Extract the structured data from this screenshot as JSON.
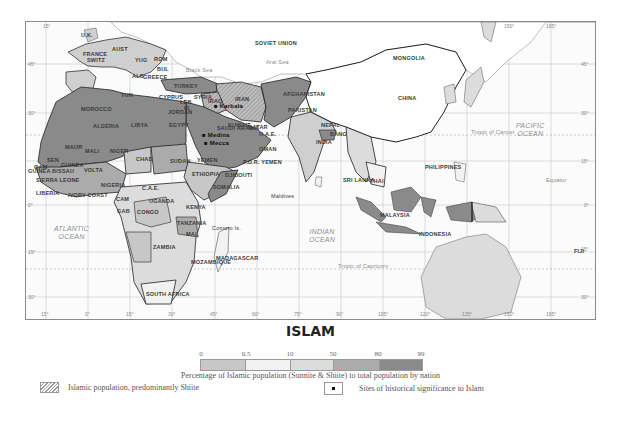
{
  "map": {
    "title": "ISLAM",
    "type": "choropleth",
    "countries": [
      {
        "name": "SOVIET UNION",
        "x": 229,
        "y": 19
      },
      {
        "name": "MONGOLIA",
        "x": 367,
        "y": 34
      },
      {
        "name": "CHINA",
        "x": 372,
        "y": 74
      },
      {
        "name": "U.K.",
        "x": 55,
        "y": 11
      },
      {
        "name": "FRANCE",
        "x": 57,
        "y": 30
      },
      {
        "name": "SWITZ",
        "x": 61,
        "y": 36
      },
      {
        "name": "AUST",
        "x": 86,
        "y": 25
      },
      {
        "name": "YUG",
        "x": 109,
        "y": 36
      },
      {
        "name": "ROM",
        "x": 128,
        "y": 35
      },
      {
        "name": "BUL",
        "x": 131,
        "y": 45
      },
      {
        "name": "ALB",
        "x": 106,
        "y": 52
      },
      {
        "name": "GREECE",
        "x": 117,
        "y": 53
      },
      {
        "name": "TURKEY",
        "x": 148,
        "y": 62
      },
      {
        "name": "CYPRUS",
        "x": 133,
        "y": 73
      },
      {
        "name": "SYRIA",
        "x": 168,
        "y": 73
      },
      {
        "name": "LEB",
        "x": 154,
        "y": 78
      },
      {
        "name": "IS",
        "x": 158,
        "y": 84
      },
      {
        "name": "IRAQ",
        "x": 182,
        "y": 77
      },
      {
        "name": "IRAN",
        "x": 209,
        "y": 75
      },
      {
        "name": "AFGHANISTAN",
        "x": 257,
        "y": 70
      },
      {
        "name": "PAKISTAN",
        "x": 262,
        "y": 86
      },
      {
        "name": "JORDAN",
        "x": 142,
        "y": 88
      },
      {
        "name": "KUWAIT",
        "x": 202,
        "y": 101
      },
      {
        "name": "QATAR",
        "x": 222,
        "y": 103
      },
      {
        "name": "U.A.E.",
        "x": 233,
        "y": 110
      },
      {
        "name": "SAUDI ARABIA",
        "x": 191,
        "y": 104
      },
      {
        "name": "OMAN",
        "x": 233,
        "y": 125
      },
      {
        "name": "P.D.R. YEMEN",
        "x": 217,
        "y": 138
      },
      {
        "name": "YEMEN",
        "x": 171,
        "y": 136
      },
      {
        "name": "TUN",
        "x": 95,
        "y": 71
      },
      {
        "name": "MOROCCO",
        "x": 55,
        "y": 85
      },
      {
        "name": "ALGERIA",
        "x": 67,
        "y": 102
      },
      {
        "name": "LIBYA",
        "x": 105,
        "y": 101
      },
      {
        "name": "EGYPT",
        "x": 143,
        "y": 101
      },
      {
        "name": "MAUR",
        "x": 39,
        "y": 123
      },
      {
        "name": "MALI",
        "x": 59,
        "y": 127
      },
      {
        "name": "NIGER",
        "x": 84,
        "y": 127
      },
      {
        "name": "CHAD",
        "x": 110,
        "y": 135
      },
      {
        "name": "SUDAN",
        "x": 144,
        "y": 137
      },
      {
        "name": "ETHIOPIA",
        "x": 166,
        "y": 150
      },
      {
        "name": "DJIBOUTI",
        "x": 199,
        "y": 151
      },
      {
        "name": "SOMALIA",
        "x": 187,
        "y": 163
      },
      {
        "name": "SEN",
        "x": 21,
        "y": 136
      },
      {
        "name": "GAM",
        "x": 8,
        "y": 143
      },
      {
        "name": "GUINEA",
        "x": 35,
        "y": 141
      },
      {
        "name": "GUINEA BISSAU",
        "x": 2,
        "y": 147
      },
      {
        "name": "SIERRA LEONE",
        "x": 10,
        "y": 156
      },
      {
        "name": "LIBERIA",
        "x": 10,
        "y": 169
      },
      {
        "name": "VOLTA",
        "x": 58,
        "y": 146
      },
      {
        "name": "IVORY COAST",
        "x": 42,
        "y": 171
      },
      {
        "name": "NIGERIA",
        "x": 75,
        "y": 161
      },
      {
        "name": "CAM",
        "x": 90,
        "y": 175
      },
      {
        "name": "C.A.E.",
        "x": 116,
        "y": 164
      },
      {
        "name": "GAB",
        "x": 91,
        "y": 187
      },
      {
        "name": "CONGO",
        "x": 111,
        "y": 188
      },
      {
        "name": "UGANDA",
        "x": 123,
        "y": 177
      },
      {
        "name": "KENYA",
        "x": 160,
        "y": 183
      },
      {
        "name": "TANZANIA",
        "x": 151,
        "y": 199
      },
      {
        "name": "MAL",
        "x": 160,
        "y": 210
      },
      {
        "name": "ZAMBIA",
        "x": 127,
        "y": 223
      },
      {
        "name": "MOZAMBIQUE",
        "x": 165,
        "y": 238
      },
      {
        "name": "MADAGASCAR",
        "x": 190,
        "y": 234
      },
      {
        "name": "SOUTH AFRICA",
        "x": 120,
        "y": 270
      },
      {
        "name": "NEPAL",
        "x": 295,
        "y": 101
      },
      {
        "name": "BANG",
        "x": 304,
        "y": 110
      },
      {
        "name": "INDIA",
        "x": 290,
        "y": 118
      },
      {
        "name": "SRI LANKA",
        "x": 317,
        "y": 156
      },
      {
        "name": "THAI",
        "x": 344,
        "y": 157
      },
      {
        "name": "PHILIPPINES",
        "x": 399,
        "y": 143
      },
      {
        "name": "MALAYSIA",
        "x": 354,
        "y": 191
      },
      {
        "name": "INDONESIA",
        "x": 393,
        "y": 210
      }
    ],
    "other_labels": [
      {
        "name": "Comoro Is.",
        "x": 186,
        "y": 207
      },
      {
        "name": "Maldives",
        "x": 245,
        "y": 175
      },
      {
        "name": "FIJI",
        "x": 548,
        "y": 230
      },
      {
        "name": "Black Sea",
        "x": 160,
        "y": 49
      },
      {
        "name": "Aral Sea",
        "x": 240,
        "y": 41
      }
    ],
    "oceans": [
      {
        "name": "ATLANTIC\nOCEAN",
        "x": 28,
        "y": 203
      },
      {
        "name": "INDIAN\nOCEAN",
        "x": 283,
        "y": 206
      },
      {
        "name": "PACIFIC\nOCEAN",
        "x": 490,
        "y": 100
      }
    ],
    "lines": [
      {
        "name": "Tropic of Cancer",
        "y": 113,
        "x": 445
      },
      {
        "name": "Equator",
        "y": 161,
        "x": 520
      },
      {
        "name": "Tropic of Capricorn",
        "y": 247,
        "x": 312
      }
    ],
    "sites": [
      {
        "name": "Karbala",
        "x": 190,
        "y": 84
      },
      {
        "name": "Medina",
        "x": 178,
        "y": 113
      },
      {
        "name": "Mecca",
        "x": 180,
        "y": 121
      }
    ],
    "longitude_ticks": [
      "15°",
      "0°",
      "15°",
      "30°",
      "45°",
      "60°",
      "75°",
      "90°",
      "105°",
      "120°",
      "135°",
      "150°",
      "165°"
    ],
    "top_ticks": [
      "15°",
      "150°",
      "165°"
    ],
    "latitude_ticks": [
      "45°",
      "30°",
      "15°",
      "0°",
      "15°",
      "30°"
    ]
  },
  "legend": {
    "title": "ISLAM",
    "scale_breaks": [
      "0",
      "0.5",
      "10",
      "50",
      "80",
      "99"
    ],
    "scale_colors": [
      "#c7c7c7",
      "#f2f2f2",
      "#dcdcdc",
      "#ababab",
      "#8a8a8a"
    ],
    "scale_caption": "Percentage of Islamic population (Sunnite & Shiite) to total population by nation",
    "shiite_label": "Islamic population, predominantly Shiite",
    "sites_label": "Sites of historical significance to Islam"
  }
}
